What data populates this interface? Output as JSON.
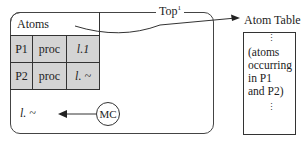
{
  "heading_partial": "",
  "main_box": {
    "header_label": "Atoms",
    "rows": [
      {
        "name": "P1",
        "type": "proc",
        "value": "l.1"
      },
      {
        "name": "P2",
        "type": "proc",
        "value": "l. ~"
      }
    ],
    "top_label": "Top",
    "top_superscript": "1",
    "mc_label": "MC",
    "mc_target": "l. ~"
  },
  "atom_table": {
    "title": "Atom Table",
    "lines": [
      "(atoms",
      "occurring",
      "in P1",
      "and P2)"
    ],
    "ellipsis": "⋮"
  },
  "colors": {
    "cell_fill": "#d4d4d4",
    "stroke": "#333333"
  }
}
